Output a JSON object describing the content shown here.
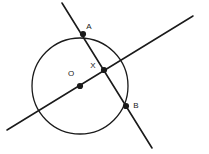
{
  "figure": {
    "type": "geometry-diagram",
    "width": 209,
    "height": 154,
    "background_color": "#ffffff",
    "stroke_color": "#1a1a1a"
  },
  "circle": {
    "name": "circle-O",
    "center_x": 80,
    "center_y": 86,
    "radius": 48,
    "stroke_width": 1.3
  },
  "lines": [
    {
      "name": "line-through-O-and-X",
      "x1": 7,
      "y1": 130,
      "x2": 193,
      "y2": 16,
      "stroke_width": 1.5
    },
    {
      "name": "line-A-B",
      "x1": 62,
      "y1": 3,
      "x2": 152,
      "y2": 148,
      "stroke_width": 1.6
    }
  ],
  "points": [
    {
      "id": "A",
      "label": "A",
      "x": 83,
      "y": 34,
      "dot_radius": 3.1,
      "label_x": 89,
      "label_y": 27
    },
    {
      "id": "X",
      "label": "X",
      "x": 104,
      "y": 70,
      "dot_radius": 3.1,
      "label_x": 93,
      "label_y": 66
    },
    {
      "id": "B",
      "label": "B",
      "x": 126,
      "y": 106,
      "dot_radius": 3.1,
      "label_x": 136,
      "label_y": 106
    },
    {
      "id": "O",
      "label": "O",
      "x": 80,
      "y": 86,
      "dot_radius": 3.1,
      "label_x": 71,
      "label_y": 74
    }
  ]
}
